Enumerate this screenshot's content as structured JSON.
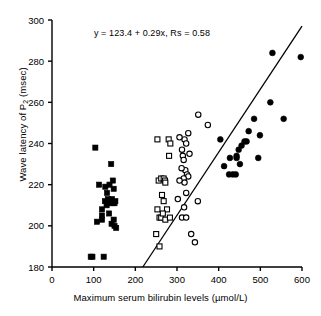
{
  "chart_data": {
    "type": "scatter",
    "title": "",
    "annotation": "y = 123.4 + 0.29x, Rs = 0.58",
    "xlabel_prefix": "Maximum serum bilirubin levels (",
    "xlabel_units": "µmol/L",
    "xlabel_suffix": ")",
    "ylabel_prefix": "Wave latency of P",
    "ylabel_sub": "2",
    "ylabel_suffix": " (msec)",
    "xlim": [
      0,
      600
    ],
    "ylim": [
      180,
      300
    ],
    "xticks": [
      0,
      100,
      200,
      300,
      400,
      500,
      600
    ],
    "yticks": [
      180,
      200,
      220,
      240,
      260,
      280,
      300
    ],
    "grid": false,
    "legend_position": "none",
    "marker_color": "#000000",
    "line_color": "#000000",
    "axis_color": "#000000",
    "regression": {
      "intercept": 123.4,
      "slope": 0.29,
      "rs": 0.58,
      "x_start": 218,
      "y_start": 180,
      "x_end": 600,
      "y_end": 297
    },
    "series": [
      {
        "name": "filled-squares",
        "marker": "square",
        "fill": "solid",
        "points": [
          [
            104,
            238
          ],
          [
            113,
            220
          ],
          [
            120,
            203
          ],
          [
            120,
            205
          ],
          [
            108,
            202
          ],
          [
            128,
            219
          ],
          [
            132,
            216
          ],
          [
            134,
            213
          ],
          [
            136,
            211
          ],
          [
            138,
            220
          ],
          [
            142,
            230
          ],
          [
            144,
            213
          ],
          [
            146,
            211
          ],
          [
            148,
            218
          ],
          [
            150,
            211
          ],
          [
            152,
            212
          ],
          [
            137,
            206
          ],
          [
            143,
            201
          ],
          [
            148,
            203
          ],
          [
            154,
            199
          ],
          [
            150,
            200
          ],
          [
            127,
            212
          ],
          [
            131,
            210
          ],
          [
            120,
            208
          ],
          [
            93,
            185
          ],
          [
            97,
            185
          ],
          [
            124,
            185
          ],
          [
            140,
            212
          ],
          [
            146,
            222
          ]
        ]
      },
      {
        "name": "open-squares",
        "marker": "square",
        "fill": "open",
        "points": [
          [
            253,
            242
          ],
          [
            280,
            242
          ],
          [
            284,
            240
          ],
          [
            281,
            234
          ],
          [
            253,
            208
          ],
          [
            256,
            222
          ],
          [
            262,
            223
          ],
          [
            268,
            223
          ],
          [
            271,
            222
          ],
          [
            264,
            215
          ],
          [
            268,
            212
          ],
          [
            258,
            204
          ],
          [
            262,
            204
          ],
          [
            276,
            208
          ],
          [
            272,
            203
          ],
          [
            283,
            204
          ],
          [
            250,
            196
          ],
          [
            258,
            190
          ],
          [
            272,
            221
          ],
          [
            266,
            206
          ]
        ]
      },
      {
        "name": "open-circles",
        "marker": "circle",
        "fill": "open",
        "points": [
          [
            351,
            254
          ],
          [
            374,
            249
          ],
          [
            327,
            245
          ],
          [
            318,
            242
          ],
          [
            322,
            240
          ],
          [
            312,
            237
          ],
          [
            314,
            234
          ],
          [
            316,
            232
          ],
          [
            320,
            227
          ],
          [
            324,
            225
          ],
          [
            327,
            224
          ],
          [
            316,
            223
          ],
          [
            318,
            221
          ],
          [
            322,
            216
          ],
          [
            311,
            228
          ],
          [
            306,
            222
          ],
          [
            330,
            235
          ],
          [
            302,
            213
          ],
          [
            317,
            209
          ],
          [
            312,
            204
          ],
          [
            322,
            204
          ],
          [
            334,
            196
          ],
          [
            343,
            192
          ],
          [
            350,
            212
          ],
          [
            306,
            243
          ]
        ]
      },
      {
        "name": "filled-circles",
        "marker": "circle",
        "fill": "solid",
        "points": [
          [
            529,
            284
          ],
          [
            597,
            282
          ],
          [
            524,
            260
          ],
          [
            485,
            252
          ],
          [
            556,
            252
          ],
          [
            472,
            246
          ],
          [
            499,
            244
          ],
          [
            404,
            242
          ],
          [
            462,
            241
          ],
          [
            467,
            241
          ],
          [
            455,
            239
          ],
          [
            448,
            237
          ],
          [
            443,
            234
          ],
          [
            427,
            233
          ],
          [
            443,
            233
          ],
          [
            495,
            233
          ],
          [
            413,
            229
          ],
          [
            425,
            225
          ],
          [
            434,
            225
          ],
          [
            441,
            225
          ],
          [
            451,
            230
          ]
        ]
      }
    ]
  }
}
